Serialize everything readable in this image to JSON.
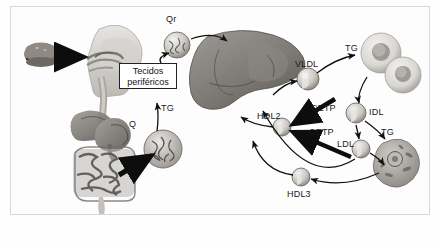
{
  "figure": {
    "language": "pt-BR",
    "background_color": "#fdfdfd",
    "border_color": "#d8d8d8",
    "ink_color": "#1a1a1a"
  },
  "labels": {
    "chylomicron_remnant": "Qr",
    "chylomicron": "Q",
    "peripheral_tissues": "Tecidos\nperiféricos",
    "peripheral_tissues_line1": "Tecidos",
    "peripheral_tissues_line2": "periféricos",
    "tg_tissues": "TG",
    "tg_intestine": "TG",
    "vldl": "VLDL",
    "tg_adipocyte": "TG",
    "idl": "IDL",
    "tg_cell": "TG",
    "ldl": "LDL",
    "hdl2": "HDL2",
    "hdl3": "HDL3",
    "cetp_upper": "CETP",
    "cetp_lower": "CETP"
  },
  "anatomy": {
    "food": "hamburger",
    "head": "head-sagittal-mouth-esophagus",
    "digestive": "stomach-liver-intestines",
    "liver": "liver-organ",
    "adipocytes": "two-adipocytes",
    "peripheral_cell": "peripheral-cell-with-nucleus"
  },
  "particles": [
    {
      "name": "chylomicron",
      "label": "Q"
    },
    {
      "name": "chylomicron-remnant",
      "label": "Qr"
    },
    {
      "name": "vldl-particle",
      "label": "VLDL"
    },
    {
      "name": "idl-particle",
      "label": "IDL"
    },
    {
      "name": "ldl-particle",
      "label": "LDL"
    },
    {
      "name": "hdl2-particle",
      "label": "HDL2"
    },
    {
      "name": "hdl3-particle",
      "label": "HDL3"
    }
  ],
  "arrows": [
    {
      "from": "food",
      "to": "mouth",
      "style": "thick-black"
    },
    {
      "from": "intestine",
      "to": "chylomicron",
      "style": "thick-black"
    },
    {
      "from": "chylomicron",
      "to": "peripheral-tissues",
      "label": "TG",
      "style": "thin"
    },
    {
      "from": "peripheral-tissues",
      "to": "chylomicron-remnant",
      "style": "thin"
    },
    {
      "from": "chylomicron-remnant",
      "to": "liver",
      "style": "thin"
    },
    {
      "from": "liver",
      "to": "vldl",
      "style": "thin"
    },
    {
      "from": "vldl",
      "to": "adipocytes",
      "label": "TG",
      "style": "thin"
    },
    {
      "from": "adipocytes",
      "to": "idl",
      "style": "thin"
    },
    {
      "from": "idl",
      "to": "ldl",
      "style": "thin"
    },
    {
      "from": "idl",
      "to": "peripheral-cell",
      "label": "TG",
      "style": "thin"
    },
    {
      "from": "ldl",
      "to": "peripheral-cell",
      "style": "thin"
    },
    {
      "from": "cetp-upper",
      "to": "hdl2",
      "style": "thick-black"
    },
    {
      "from": "cetp-lower",
      "to": "hdl2",
      "style": "thick-black"
    },
    {
      "from": "hdl2",
      "to": "liver",
      "style": "thin"
    },
    {
      "from": "hdl3",
      "to": "liver",
      "style": "thin"
    },
    {
      "from": "peripheral-cell",
      "to": "hdl3",
      "style": "thin"
    },
    {
      "from": "ldl",
      "to": "liver",
      "style": "thin"
    }
  ]
}
